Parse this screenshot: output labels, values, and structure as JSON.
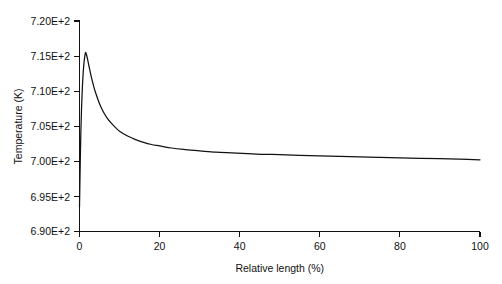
{
  "chart_data": {
    "type": "line",
    "title": "",
    "subtitle": "",
    "xlabel": "Relative length (%)",
    "ylabel": "Temperature (K)",
    "xlim": [
      0,
      100
    ],
    "ylim": [
      690,
      720
    ],
    "grid": false,
    "legend": null,
    "xticks": [
      0,
      20,
      40,
      60,
      80,
      100
    ],
    "xticklabels": [
      "0",
      "20",
      "40",
      "60",
      "80",
      "100"
    ],
    "yticks": [
      690,
      695,
      700,
      705,
      710,
      715,
      720
    ],
    "yticklabels": [
      "6.90E+2",
      "6.95E+2",
      "7.00E+2",
      "7.05E+2",
      "7.10E+2",
      "7.15E+2",
      "7.20E+2"
    ],
    "series": [
      {
        "name": "Temperature profile",
        "color": "#111111",
        "x": [
          0.0,
          0.15,
          0.3,
          0.5,
          0.7,
          0.9,
          1.1,
          1.3,
          1.5,
          1.7,
          2.0,
          2.5,
          3.0,
          3.5,
          4.0,
          5.0,
          6.0,
          7.0,
          8.0,
          9.0,
          10.0,
          12.0,
          14.0,
          16.0,
          18.0,
          20.0,
          23.0,
          26.0,
          30.0,
          34.0,
          38.0,
          42.0,
          46.0,
          50.0,
          55.0,
          60.0,
          65.0,
          70.0,
          75.0,
          80.0,
          85.0,
          90.0,
          95.0,
          100.0
        ],
        "y": [
          693.5,
          698.6,
          703.2,
          707.4,
          710.3,
          712.4,
          713.9,
          714.9,
          715.5,
          715.3,
          714.6,
          713.2,
          711.9,
          710.8,
          709.8,
          708.2,
          707.0,
          706.1,
          705.4,
          704.8,
          704.3,
          703.6,
          703.1,
          702.7,
          702.4,
          702.2,
          701.9,
          701.7,
          701.5,
          701.3,
          701.2,
          701.1,
          701.0,
          700.95,
          700.85,
          700.78,
          700.7,
          700.63,
          700.56,
          700.5,
          700.43,
          700.37,
          700.3,
          700.22
        ],
        "peak": {
          "x": 1.5,
          "y": 715.5
        },
        "start": {
          "x": 0.0,
          "y": 693.5
        },
        "end": {
          "x": 100.0,
          "y": 700.22
        }
      }
    ]
  },
  "figure": {
    "background": "#ffffff",
    "axis_color": "#111111",
    "curve_color": "#111111"
  }
}
